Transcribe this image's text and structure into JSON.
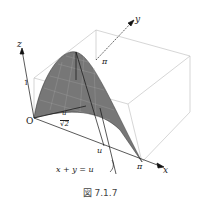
{
  "figure": {
    "caption": "図 7.1.7",
    "labels": {
      "x_axis": "x",
      "y_axis": "y",
      "z_axis": "z",
      "origin": "O",
      "z_tick_1": "1",
      "x_tick_pi": "π",
      "y_tick_pi": "π",
      "u_on_x": "u",
      "half_u_num": "u",
      "half_u_den": "√2",
      "line_label": "x + y = u"
    }
  }
}
